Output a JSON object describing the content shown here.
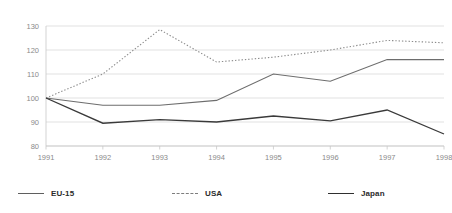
{
  "chart_data": {
    "type": "line",
    "title": "",
    "subtitle": "",
    "xlabel": "",
    "ylabel": "",
    "categories": [
      "1991",
      "1992",
      "1993",
      "1994",
      "1995",
      "1996",
      "1997",
      "1998"
    ],
    "x": [
      1991,
      1992,
      1993,
      1994,
      1995,
      1996,
      1997,
      1998
    ],
    "ylim": [
      80,
      130
    ],
    "yticks": [
      80,
      90,
      100,
      110,
      120,
      130
    ],
    "ytick_labels": [
      "80",
      "90",
      "100",
      "110",
      "120",
      "130"
    ],
    "grid": true,
    "grid_axis": "y",
    "legend_position": "bottom",
    "series": [
      {
        "name": "EU-15",
        "style": "solid",
        "color": "#6d6d6d",
        "values": [
          100,
          97,
          97,
          99,
          110,
          107,
          116,
          116
        ]
      },
      {
        "name": "USA",
        "style": "dotted",
        "color": "#8c8c8c",
        "values": [
          100,
          110,
          128.5,
          115,
          117,
          120,
          124,
          123
        ]
      },
      {
        "name": "Japan",
        "style": "solid",
        "color": "#3a3a3a",
        "values": [
          100,
          89.5,
          91,
          90,
          92.5,
          90.5,
          95,
          85
        ]
      }
    ]
  },
  "legend": {
    "items": [
      {
        "label": "EU-15"
      },
      {
        "label": "USA"
      },
      {
        "label": "Japan"
      }
    ]
  },
  "axes": {
    "y": {
      "labels": [
        "130",
        "120",
        "110",
        "100",
        "90",
        "80"
      ]
    },
    "x": {
      "labels": [
        "1991",
        "1992",
        "1993",
        "1994",
        "1995",
        "1996",
        "1997",
        "1998"
      ]
    }
  },
  "colors": {
    "background": "#ffffff",
    "gridline": "#d9d9d9",
    "axis": "#c8c8c8",
    "tick_text": "#8a8a8a",
    "legend_text": "#2b2b2b",
    "eu15": "#6d6d6d",
    "usa": "#8c8c8c",
    "japan": "#3a3a3a"
  }
}
